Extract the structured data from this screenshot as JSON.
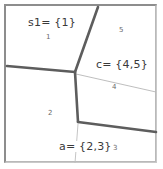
{
  "diagram": {
    "type": "partition-diagram",
    "title": "",
    "background_color": "#ffffff",
    "frame_color": "#8d8d8d",
    "boundary_color": "#5a5a5a",
    "leader_color": "#b0b0b0",
    "text_color": "#3a3a3a",
    "set_labels": [
      {
        "id": "s1",
        "text": "s1= {1}",
        "x": 28,
        "y": 22
      },
      {
        "id": "c",
        "text": "c= {4,5}",
        "x": 95,
        "y": 64
      },
      {
        "id": "a",
        "text": "a= {2,3}",
        "x": 58,
        "y": 146
      }
    ],
    "region_numbers": [
      {
        "id": "region-1",
        "text": "1",
        "x": 46,
        "y": 38
      },
      {
        "id": "region-5",
        "text": "5",
        "x": 119,
        "y": 31
      },
      {
        "id": "region-4",
        "text": "4",
        "x": 112,
        "y": 88
      },
      {
        "id": "region-2",
        "text": "2",
        "x": 48,
        "y": 114
      },
      {
        "id": "region-3",
        "text": "3",
        "x": 113,
        "y": 149
      }
    ],
    "boundaries": [
      {
        "id": "boundary-top-vertical",
        "points": "98,7 75,72"
      },
      {
        "id": "boundary-left-horizontal",
        "points": "7,66 75,72"
      },
      {
        "id": "boundary-middle-vertical",
        "points": "75,72 78,122"
      },
      {
        "id": "boundary-bottom-right",
        "points": "78,122 156,132"
      }
    ],
    "leaders": [
      {
        "id": "leader-c",
        "points": "76,74 156,92"
      },
      {
        "id": "leader-a",
        "points": "78,124 75,162"
      }
    ]
  }
}
